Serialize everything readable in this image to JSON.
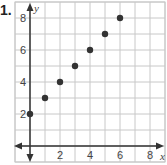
{
  "problem": {
    "label": "1."
  },
  "chart_data": {
    "type": "scatter",
    "title": "",
    "xlabel": "x",
    "ylabel": "y",
    "x": [
      0,
      1,
      2,
      3,
      4,
      5,
      6
    ],
    "y": [
      2,
      3,
      4,
      5,
      6,
      7,
      8
    ],
    "series": [
      {
        "name": "points",
        "values": [
          [
            0,
            2
          ],
          [
            1,
            3
          ],
          [
            2,
            4
          ],
          [
            3,
            5
          ],
          [
            4,
            6
          ],
          [
            5,
            7
          ],
          [
            6,
            8
          ]
        ]
      }
    ],
    "x_ticks": [
      2,
      4,
      6,
      8
    ],
    "y_ticks": [
      2,
      4,
      6,
      8
    ],
    "xlim": [
      -1,
      9
    ],
    "ylim": [
      -1,
      9
    ],
    "grid": true,
    "legend": "none",
    "colors": {
      "grid": "#c8c8c8",
      "axis": "#333333",
      "point": "#333333",
      "text": "#444444"
    }
  }
}
